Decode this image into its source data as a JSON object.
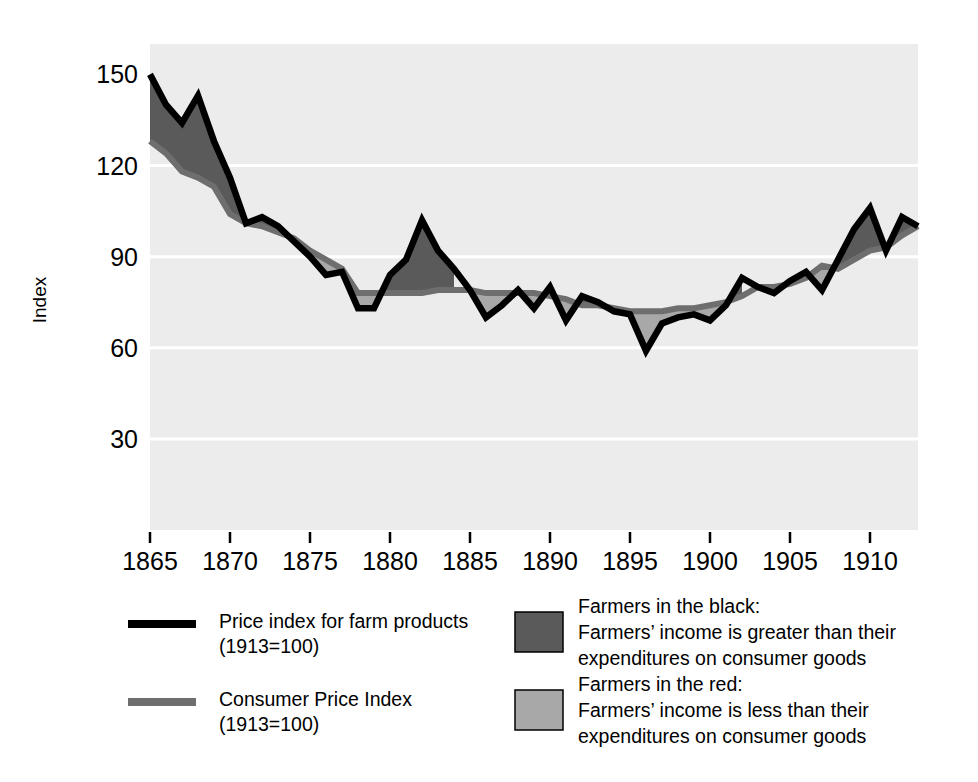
{
  "chart_data": {
    "type": "area",
    "title": "",
    "xlabel": "",
    "ylabel": "Index",
    "xlim": [
      1865,
      1913
    ],
    "ylim": [
      0,
      160
    ],
    "grid": true,
    "gridlines_y": [
      30,
      60,
      90,
      120
    ],
    "legend_position": "bottom",
    "yticks": [
      30,
      60,
      90,
      120,
      150
    ],
    "ytick_labels": [
      "30",
      "60",
      "90",
      "120",
      "150"
    ],
    "xticks": [
      1865,
      1870,
      1875,
      1880,
      1885,
      1890,
      1895,
      1900,
      1905,
      1910
    ],
    "xtick_labels": [
      "1865",
      "1870",
      "1875",
      "1880",
      "1885",
      "1890",
      "1895",
      "1900",
      "1905",
      "1910"
    ],
    "x": [
      1865,
      1866,
      1867,
      1868,
      1869,
      1870,
      1871,
      1872,
      1873,
      1874,
      1875,
      1876,
      1877,
      1878,
      1879,
      1880,
      1881,
      1882,
      1883,
      1884,
      1885,
      1886,
      1887,
      1888,
      1889,
      1890,
      1891,
      1892,
      1893,
      1894,
      1895,
      1896,
      1897,
      1898,
      1899,
      1900,
      1901,
      1902,
      1903,
      1904,
      1905,
      1906,
      1907,
      1908,
      1909,
      1910,
      1911,
      1912,
      1913
    ],
    "series": [
      {
        "name": "Price index for farm products (1913=100)",
        "color": "#000000",
        "values": [
          150,
          140,
          134,
          143,
          128,
          116,
          101,
          103,
          100,
          95,
          90,
          84,
          85,
          73,
          73,
          84,
          89,
          102,
          92,
          86,
          79,
          70,
          74,
          79,
          73,
          80,
          69,
          77,
          75,
          72,
          71,
          59,
          68,
          70,
          71,
          69,
          74,
          83,
          80,
          78,
          82,
          85,
          79,
          89,
          99,
          106,
          92,
          103,
          100
        ]
      },
      {
        "name": "Consumer Price Index (1913=100)",
        "color": "#6e6e6e",
        "values": [
          128,
          124,
          118,
          116,
          113,
          104,
          101,
          100,
          98,
          96,
          92,
          89,
          86,
          78,
          78,
          78,
          78,
          78,
          79,
          79,
          79,
          78,
          78,
          78,
          78,
          77,
          76,
          74,
          74,
          73,
          72,
          72,
          72,
          73,
          73,
          74,
          75,
          77,
          80,
          80,
          81,
          83,
          87,
          86,
          89,
          92,
          93,
          97,
          100
        ]
      }
    ],
    "fills": [
      {
        "name": "Farmers in the black",
        "color": "#5a5a5a",
        "meaning": "farm price index above CPI"
      },
      {
        "name": "Farmers in the red",
        "color": "#a8a8a8",
        "meaning": "farm price index below CPI"
      }
    ],
    "plot_background": "#ececec",
    "gridline_color": "#ffffff"
  },
  "axes": {
    "y_title": "Index"
  },
  "legend": {
    "line_entries": [
      {
        "swatch": "black-line-swatch",
        "line1": "Price index for farm products",
        "line2": "(1913=100)",
        "color": "#000000"
      },
      {
        "swatch": "gray-line-swatch",
        "line1": "Consumer Price Index",
        "line2": "(1913=100)",
        "color": "#6e6e6e"
      }
    ],
    "area_entries": [
      {
        "swatch": "dark-gray-box-swatch",
        "color": "#5a5a5a",
        "line1": "Farmers in the black:",
        "line2": "Farmers’ income is greater than their",
        "line3": "expenditures on consumer goods"
      },
      {
        "swatch": "light-gray-box-swatch",
        "color": "#a8a8a8",
        "line1": "Farmers in the red:",
        "line2": "Farmers’ income is less than their",
        "line3": "expenditures on consumer goods"
      }
    ]
  }
}
